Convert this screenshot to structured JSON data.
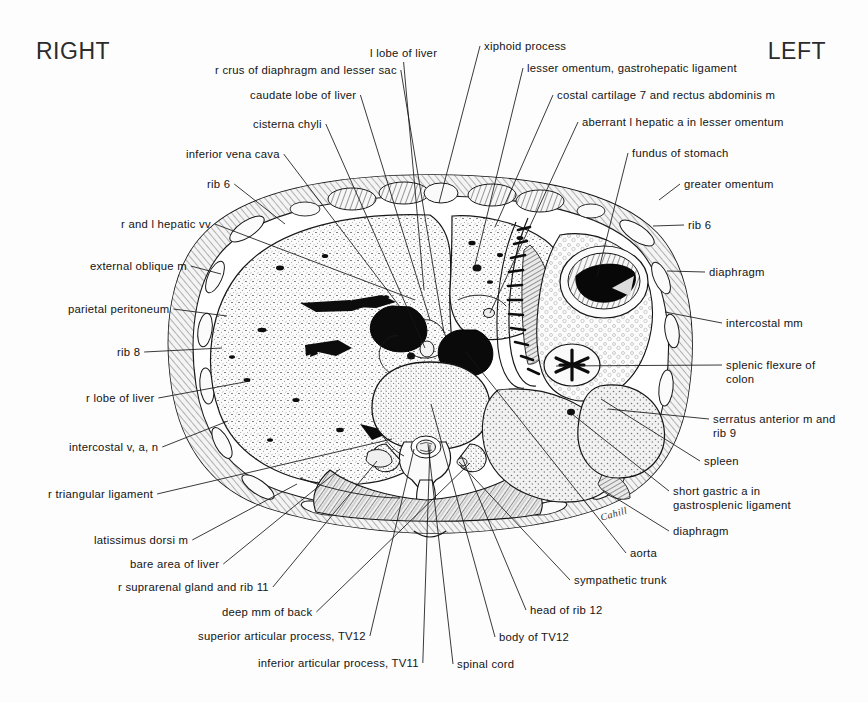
{
  "figure": {
    "orientation": {
      "left_heading": "RIGHT",
      "right_heading": "LEFT"
    },
    "signature": "Cahill",
    "ink_color": "#141414",
    "paper_color": "#fdfdfd"
  },
  "labels": [
    {
      "id": "l-lobe-of-liver",
      "text": "l lobe of liver",
      "x": 370,
      "y": 46,
      "align": "left",
      "tip_x": 424,
      "tip_y": 290
    },
    {
      "id": "xiphoid-process",
      "text": "xiphoid process",
      "x": 484,
      "y": 39,
      "align": "left",
      "tip_x": 439,
      "tip_y": 203
    },
    {
      "id": "r-crus-of-diaphragm-and-lesser-sac",
      "text": "r crus of diaphragm and lesser sac",
      "x": 215,
      "y": 63,
      "align": "left",
      "tip_x": 444,
      "tip_y": 333
    },
    {
      "id": "lesser-omentum-gastrohepatic-ligament",
      "text": "lesser omentum, gastrohepatic ligament",
      "x": 527,
      "y": 61,
      "align": "left",
      "tip_x": 474,
      "tip_y": 269
    },
    {
      "id": "caudate-lobe-of-liver",
      "text": "caudate lobe of liver",
      "x": 250,
      "y": 88,
      "align": "left",
      "tip_x": 430,
      "tip_y": 320
    },
    {
      "id": "costal-cartilage-7-and-rectus",
      "text": "costal cartilage 7 and rectus abdominis m",
      "x": 557,
      "y": 88,
      "align": "left",
      "tip_x": 495,
      "tip_y": 227
    },
    {
      "id": "cisterna-chyli",
      "text": "cisterna chyli",
      "x": 253,
      "y": 117,
      "align": "left",
      "tip_x": 425,
      "tip_y": 348
    },
    {
      "id": "aberrant-l-hepatic-a",
      "text": "aberrant l hepatic a in lesser omentum",
      "x": 582,
      "y": 115,
      "align": "left",
      "tip_x": 490,
      "tip_y": 313
    },
    {
      "id": "inferior-vena-cava",
      "text": "inferior vena cava",
      "x": 186,
      "y": 147,
      "align": "left",
      "tip_x": 400,
      "tip_y": 307
    },
    {
      "id": "fundus-of-stomach",
      "text": "fundus of stomach",
      "x": 632,
      "y": 146,
      "align": "left",
      "tip_x": 597,
      "tip_y": 277
    },
    {
      "id": "rib-6-left-upper",
      "text": "rib 6",
      "x": 207,
      "y": 177,
      "align": "left",
      "tip_x": 285,
      "tip_y": 224
    },
    {
      "id": "greater-omentum",
      "text": "greater omentum",
      "x": 684,
      "y": 177,
      "align": "left",
      "tip_x": 659,
      "tip_y": 200
    },
    {
      "id": "r-and-l-hepatic-vv",
      "text": "r and l hepatic vv",
      "x": 121,
      "y": 217,
      "align": "left",
      "tip_x": 415,
      "tip_y": 300
    },
    {
      "id": "rib-6-right",
      "text": "rib 6",
      "x": 688,
      "y": 218,
      "align": "left",
      "tip_x": 653,
      "tip_y": 226
    },
    {
      "id": "external-oblique-m",
      "text": "external oblique m",
      "x": 90,
      "y": 259,
      "align": "left",
      "tip_x": 221,
      "tip_y": 274
    },
    {
      "id": "diaphragm-right-upper",
      "text": "diaphragm",
      "x": 709,
      "y": 265,
      "align": "left",
      "tip_x": 667,
      "tip_y": 271
    },
    {
      "id": "parietal-peritoneum",
      "text": "parietal peritoneum",
      "x": 68,
      "y": 302,
      "align": "left",
      "tip_x": 227,
      "tip_y": 316
    },
    {
      "id": "intercostal-mm",
      "text": "intercostal mm",
      "x": 726,
      "y": 316,
      "align": "left",
      "tip_x": 665,
      "tip_y": 312
    },
    {
      "id": "rib-8",
      "text": "rib 8",
      "x": 117,
      "y": 345,
      "align": "left",
      "tip_x": 222,
      "tip_y": 348
    },
    {
      "id": "splenic-flexure-of-colon",
      "text": "splenic flexure of\ncolon",
      "x": 726,
      "y": 358,
      "align": "left",
      "tip_x": 556,
      "tip_y": 366
    },
    {
      "id": "r-lobe-of-liver",
      "text": "r lobe of liver",
      "x": 86,
      "y": 391,
      "align": "left",
      "tip_x": 250,
      "tip_y": 381
    },
    {
      "id": "serratus-anterior-m-and-rib-9",
      "text": "serratus anterior m and\nrib 9",
      "x": 713,
      "y": 412,
      "align": "left",
      "tip_x": 608,
      "tip_y": 409
    },
    {
      "id": "intercostal-v-a-n",
      "text": "intercostal v, a, n",
      "x": 69,
      "y": 440,
      "align": "left",
      "tip_x": 228,
      "tip_y": 421
    },
    {
      "id": "spleen",
      "text": "spleen",
      "x": 704,
      "y": 454,
      "align": "left",
      "tip_x": 601,
      "tip_y": 399
    },
    {
      "id": "r-triangular-ligament",
      "text": "r triangular ligament",
      "x": 48,
      "y": 487,
      "align": "left",
      "tip_x": 392,
      "tip_y": 439
    },
    {
      "id": "short-gastric-a-in-gastrosplenic",
      "text": "short gastric a in\ngastrosplenic ligament",
      "x": 673,
      "y": 484,
      "align": "left",
      "tip_x": 572,
      "tip_y": 414
    },
    {
      "id": "latissimus-dorsi-m",
      "text": "latissimus dorsi m",
      "x": 94,
      "y": 533,
      "align": "left",
      "tip_x": 297,
      "tip_y": 484
    },
    {
      "id": "diaphragm-right-lower",
      "text": "diaphragm",
      "x": 673,
      "y": 524,
      "align": "left",
      "tip_x": 603,
      "tip_y": 490
    },
    {
      "id": "bare-area-of-liver",
      "text": "bare area of liver",
      "x": 130,
      "y": 557,
      "align": "left",
      "tip_x": 340,
      "tip_y": 469
    },
    {
      "id": "aorta",
      "text": "aorta",
      "x": 630,
      "y": 546,
      "align": "left",
      "tip_x": 466,
      "tip_y": 352
    },
    {
      "id": "r-suprarenal-gland-and-rib-11",
      "text": "r suprarenal gland and rib 11",
      "x": 118,
      "y": 580,
      "align": "left",
      "tip_x": 377,
      "tip_y": 461
    },
    {
      "id": "sympathetic-trunk",
      "text": "sympathetic trunk",
      "x": 574,
      "y": 573,
      "align": "left",
      "tip_x": 459,
      "tip_y": 462
    },
    {
      "id": "deep-mm-of-back",
      "text": "deep mm of back",
      "x": 222,
      "y": 605,
      "align": "left",
      "tip_x": 470,
      "tip_y": 463
    },
    {
      "id": "head-of-rib-12",
      "text": "head of rib 12",
      "x": 530,
      "y": 603,
      "align": "left",
      "tip_x": 461,
      "tip_y": 455
    },
    {
      "id": "superior-articular-process-tv12",
      "text": "superior articular process, TV12",
      "x": 198,
      "y": 629,
      "align": "left",
      "tip_x": 414,
      "tip_y": 449
    },
    {
      "id": "body-of-tv12",
      "text": "body of TV12",
      "x": 499,
      "y": 630,
      "align": "left",
      "tip_x": 431,
      "tip_y": 404
    },
    {
      "id": "inferior-articular-process-tv11",
      "text": "inferior articular process, TV11",
      "x": 258,
      "y": 656,
      "align": "left",
      "tip_x": 430,
      "tip_y": 445
    },
    {
      "id": "spinal-cord",
      "text": "spinal cord",
      "x": 457,
      "y": 657,
      "align": "left",
      "tip_x": 428,
      "tip_y": 444
    }
  ]
}
